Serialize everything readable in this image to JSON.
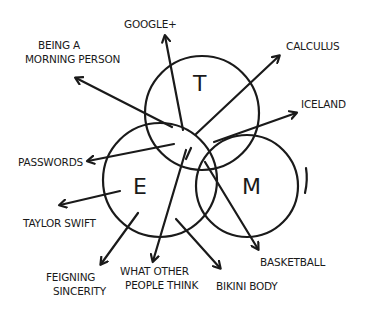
{
  "diagram": {
    "type": "venn-with-arrows",
    "stroke_color": "#1a1a1a",
    "background": "#ffffff",
    "circles": [
      {
        "id": "T",
        "label": "T",
        "cx": 202,
        "cy": 113,
        "r": 57
      },
      {
        "id": "E",
        "label": "E",
        "cx": 160,
        "cy": 180,
        "r": 57
      },
      {
        "id": "M",
        "label": "M",
        "cx": 247,
        "cy": 186,
        "r": 51
      }
    ],
    "labels": {
      "googleplus": "Google+",
      "morning_line1": "Being a",
      "morning_line2": "Morning Person",
      "calculus": "Calculus",
      "iceland": "Iceland",
      "passwords": "Passwords",
      "taylor": "Taylor Swift",
      "feigning_line1": "Feigning",
      "feigning_line2": "Sincerity",
      "whatother_line1": "What Other",
      "whatother_line2": "People Think",
      "bikini": "Bikini Body",
      "basketball": "Basketball"
    }
  }
}
